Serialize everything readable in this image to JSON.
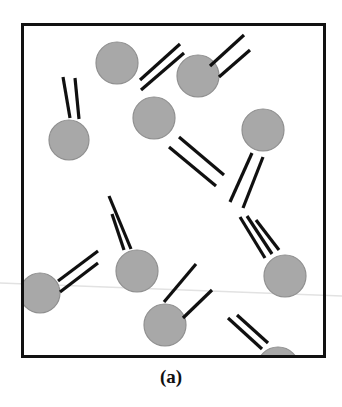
{
  "figure": {
    "caption": "(a)",
    "type": "schematic-diagram",
    "colors": {
      "background": "#ffffff",
      "frame_stroke": "#111111",
      "particle_fill": "#a8a8a8",
      "particle_stroke": "#8f8f8f",
      "rod_stroke": "#101010",
      "scan_line": "#e2e2e2"
    },
    "frame": {
      "x": 21,
      "y": 23,
      "width": 305,
      "height": 335,
      "stroke_width": 3
    },
    "particle_radius": 21,
    "rod_width": 3.2,
    "particles": [
      {
        "id": "p1",
        "cx": 117,
        "cy": 63,
        "r": 21
      },
      {
        "id": "p2",
        "cx": 198,
        "cy": 76,
        "r": 21
      },
      {
        "id": "p3",
        "cx": 69,
        "cy": 140,
        "r": 20
      },
      {
        "id": "p4",
        "cx": 154,
        "cy": 118,
        "r": 21
      },
      {
        "id": "p5",
        "cx": 263,
        "cy": 130,
        "r": 21
      },
      {
        "id": "p6",
        "cx": 137,
        "cy": 271,
        "r": 21
      },
      {
        "id": "p7",
        "cx": 40,
        "cy": 293,
        "r": 20
      },
      {
        "id": "p8",
        "cx": 285,
        "cy": 276,
        "r": 21
      },
      {
        "id": "p9",
        "cx": 165,
        "cy": 325,
        "r": 21
      },
      {
        "id": "p10",
        "cx": 278,
        "cy": 368,
        "r": 21
      }
    ],
    "rods": [
      {
        "id": "r1",
        "x1": 140,
        "y1": 80,
        "x2": 180,
        "y2": 44
      },
      {
        "id": "r2",
        "x1": 141,
        "y1": 90,
        "x2": 184,
        "y2": 53
      },
      {
        "id": "r3",
        "x1": 210,
        "y1": 66,
        "x2": 244,
        "y2": 35
      },
      {
        "id": "r4",
        "x1": 219,
        "y1": 77,
        "x2": 250,
        "y2": 50
      },
      {
        "id": "r5",
        "x1": 70,
        "y1": 118,
        "x2": 63,
        "y2": 77
      },
      {
        "id": "r6",
        "x1": 79,
        "y1": 119,
        "x2": 75,
        "y2": 78
      },
      {
        "id": "r7",
        "x1": 169,
        "y1": 147,
        "x2": 216,
        "y2": 186
      },
      {
        "id": "r8",
        "x1": 179,
        "y1": 137,
        "x2": 224,
        "y2": 175
      },
      {
        "id": "r9",
        "x1": 252,
        "y1": 153,
        "x2": 230,
        "y2": 202
      },
      {
        "id": "r10",
        "x1": 263,
        "y1": 157,
        "x2": 243,
        "y2": 208
      },
      {
        "id": "r11",
        "x1": 124,
        "y1": 250,
        "x2": 112,
        "y2": 214
      },
      {
        "id": "r12",
        "x1": 131,
        "y1": 249,
        "x2": 109,
        "y2": 196
      },
      {
        "id": "r13",
        "x1": 58,
        "y1": 281,
        "x2": 98,
        "y2": 251
      },
      {
        "id": "r14",
        "x1": 60,
        "y1": 292,
        "x2": 98,
        "y2": 263
      },
      {
        "id": "r15",
        "x1": 265,
        "y1": 258,
        "x2": 240,
        "y2": 217
      },
      {
        "id": "r16",
        "x1": 272,
        "y1": 254,
        "x2": 247,
        "y2": 216
      },
      {
        "id": "r17",
        "x1": 279,
        "y1": 250,
        "x2": 256,
        "y2": 220
      },
      {
        "id": "r18",
        "x1": 164,
        "y1": 302,
        "x2": 196,
        "y2": 264
      },
      {
        "id": "r19",
        "x1": 183,
        "y1": 318,
        "x2": 212,
        "y2": 290
      },
      {
        "id": "r20",
        "x1": 262,
        "y1": 349,
        "x2": 228,
        "y2": 318
      },
      {
        "id": "r21",
        "x1": 268,
        "y1": 343,
        "x2": 237,
        "y2": 315
      }
    ],
    "scan_line": {
      "x1": 0,
      "y1": 283,
      "x2": 342,
      "y2": 296
    }
  }
}
